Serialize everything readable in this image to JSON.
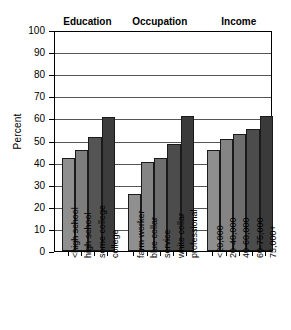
{
  "chart_data": {
    "type": "bar",
    "title": "",
    "xlabel": "",
    "ylabel": "Percent",
    "ylim": [
      0,
      100
    ],
    "ytick_labels": [
      "100",
      "90",
      "80",
      "70",
      "60",
      "50",
      "40",
      "30",
      "20",
      "10",
      "0"
    ],
    "ytick_values": [
      100,
      90,
      80,
      70,
      60,
      50,
      40,
      30,
      20,
      10,
      0
    ],
    "grid": "horizontal",
    "legend": "none",
    "groups": [
      {
        "name": "Education",
        "categories": [
          "<high school",
          "high school",
          "some college",
          "college"
        ],
        "values": [
          42,
          45.5,
          51.5,
          60.5
        ],
        "colors": [
          "#8f8f8f",
          "#7d7d7d",
          "#545454",
          "#3c3c3c"
        ]
      },
      {
        "name": "Occupation",
        "categories": [
          "farm worker",
          "blue collar",
          "service",
          "white collar",
          "professional"
        ],
        "values": [
          26,
          40.5,
          42,
          48.5,
          61
        ],
        "colors": [
          "#8f8f8f",
          "#848484",
          "#6e6e6e",
          "#4c4c4c",
          "#3a3a3a"
        ]
      },
      {
        "name": "Income",
        "categories": [
          "<20,000",
          "20-40,000",
          "40-60,000",
          "60-75,000",
          "75,000+"
        ],
        "values": [
          45.5,
          50.5,
          53,
          55,
          61
        ],
        "colors": [
          "#8f8f8f",
          "#848484",
          "#6e6e6e",
          "#4c4c4c",
          "#3a3a3a"
        ]
      }
    ]
  }
}
